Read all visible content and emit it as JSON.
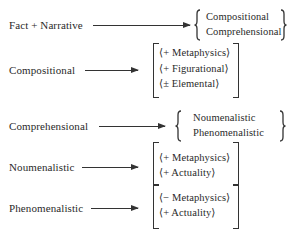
{
  "diagram": {
    "rows": [
      {
        "source": "Fact + Narrative",
        "relation": "arrow",
        "grouping": "brace",
        "targets": [
          "Compositional",
          "Comprehensional"
        ]
      },
      {
        "source": "Compositional",
        "relation": "arrow",
        "grouping": "bracket",
        "targets": [
          "⟨+ Metaphysics⟩",
          "⟨+ Figurational⟩",
          "⟨± Elemental⟩"
        ]
      },
      {
        "source": "Comprehensional",
        "relation": "arrow",
        "grouping": "brace",
        "targets": [
          "Noumenalistic",
          "Phenomenalistic"
        ]
      },
      {
        "source": "Noumenalistic",
        "relation": "arrow",
        "grouping": "bracket",
        "targets": [
          "⟨+ Metaphysics⟩",
          "⟨+ Actuality⟩"
        ]
      },
      {
        "source": "Phenomenalistic",
        "relation": "arrow",
        "grouping": "bracket",
        "targets": [
          "⟨− Metaphysics⟩",
          "⟨+ Actuality⟩"
        ]
      }
    ]
  },
  "colors": {
    "ink": "#2a2a2a",
    "background": "#ffffff"
  }
}
